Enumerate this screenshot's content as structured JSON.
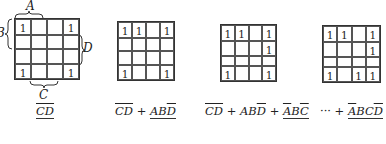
{
  "labels": {
    "A": "A",
    "B": "B",
    "C": "C",
    "D": "D"
  },
  "maps": [
    {
      "cells": [
        [
          "1",
          "",
          "",
          "1"
        ],
        [
          "",
          "",
          "",
          ""
        ],
        [
          "",
          "",
          "",
          ""
        ],
        [
          "1",
          "",
          "",
          "1"
        ]
      ]
    },
    {
      "cells": [
        [
          "1",
          "1",
          "",
          "1"
        ],
        [
          "",
          "",
          "",
          ""
        ],
        [
          "",
          "",
          "",
          ""
        ],
        [
          "1",
          "",
          "",
          "1"
        ]
      ]
    },
    {
      "cells": [
        [
          "1",
          "1",
          "",
          "1"
        ],
        [
          "",
          "",
          "",
          "1"
        ],
        [
          "",
          "",
          "",
          ""
        ],
        [
          "1",
          "",
          "",
          "1"
        ]
      ]
    },
    {
      "cells": [
        [
          "1",
          "1",
          "",
          "1"
        ],
        [
          "",
          "",
          "",
          "1"
        ],
        [
          "",
          "",
          "",
          ""
        ],
        [
          "1",
          "",
          "1",
          "1"
        ]
      ]
    }
  ],
  "formulas": [
    {
      "text": "C̅D̅",
      "terms": [
        {
          "lit": "CD",
          "over": "CD",
          "highlight": true
        }
      ]
    },
    {
      "text": "C̅D̅ + ABD̅"
    },
    {
      "text": "C̅D̅ + ABD̅ + A̅BC̅"
    },
    {
      "text": "··· + A̅BCD̅"
    }
  ],
  "formula_parts": {
    "f1": {
      "t1": "CD"
    },
    "f2": {
      "t1": "CD",
      "plus": " + ",
      "t2a": "AB",
      "t2b": "D"
    },
    "f3": {
      "t1": "CD",
      "plus1": " + ",
      "t2a": "AB",
      "t2b": "D",
      "plus2": " + ",
      "t3a": "A",
      "t3b": "B",
      "t3c": "C"
    },
    "f4": {
      "dots": "··· + ",
      "t4a": "A",
      "t4b": "BC",
      "t4c": "D"
    }
  }
}
